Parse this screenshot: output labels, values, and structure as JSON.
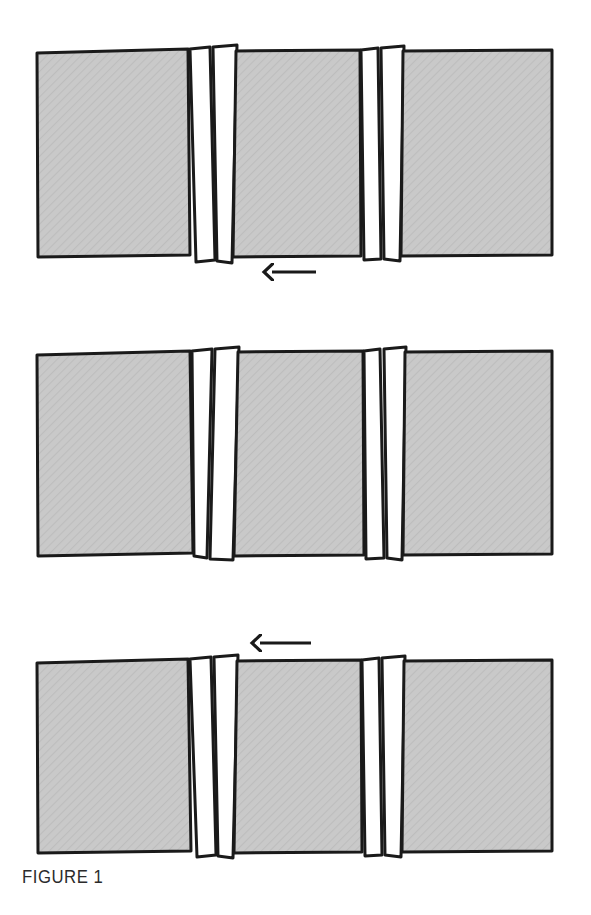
{
  "figure": {
    "caption": "FIGURE 1",
    "title": "FIGURE 1",
    "type": "patent-line-drawing",
    "background_color": "#ffffff",
    "stroke_color": "#1a1a1a",
    "panel_fill_color": "#c9c9c9",
    "strip_fill_color": "#ffffff",
    "hatch_color": "#b3b3b3",
    "canvas": {
      "width": 591,
      "height": 915
    }
  },
  "assemblies": [
    {
      "id": "assembly-top",
      "label": "Top assembly",
      "order": 1,
      "bounds": {
        "x": 36,
        "y": 50,
        "width": 517,
        "height": 208
      },
      "panels": [
        {
          "id": "top-panel-left",
          "label": "Left panel",
          "fill": "#c9c9c9"
        },
        {
          "id": "top-panel-center",
          "label": "Center panel",
          "fill": "#c9c9c9"
        },
        {
          "id": "top-panel-right",
          "label": "Right panel",
          "fill": "#c9c9c9"
        }
      ],
      "joints": [
        {
          "id": "top-joint-left",
          "label": "Left joint",
          "strips": [
            {
              "id": "top-joint-left-strip-1",
              "label": "Strip 1",
              "fill": "#ffffff"
            },
            {
              "id": "top-joint-left-strip-2",
              "label": "Strip 2",
              "fill": "#ffffff"
            }
          ]
        },
        {
          "id": "top-joint-right",
          "label": "Right joint",
          "strips": [
            {
              "id": "top-joint-right-strip-1",
              "label": "Strip 1",
              "fill": "#ffffff"
            },
            {
              "id": "top-joint-right-strip-2",
              "label": "Strip 2",
              "fill": "#ffffff"
            }
          ]
        }
      ]
    },
    {
      "id": "assembly-middle",
      "label": "Middle assembly",
      "order": 2,
      "bounds": {
        "x": 36,
        "y": 350,
        "width": 517,
        "height": 207
      },
      "panels": [
        {
          "id": "middle-panel-left",
          "label": "Left panel",
          "fill": "#c9c9c9"
        },
        {
          "id": "middle-panel-center",
          "label": "Center panel",
          "fill": "#c9c9c9"
        },
        {
          "id": "middle-panel-right",
          "label": "Right panel",
          "fill": "#c9c9c9"
        }
      ],
      "joints": [
        {
          "id": "middle-joint-left",
          "label": "Left joint",
          "strips": [
            {
              "id": "middle-joint-left-strip-1",
              "label": "Strip 1",
              "fill": "#ffffff"
            },
            {
              "id": "middle-joint-left-strip-2",
              "label": "Strip 2",
              "fill": "#ffffff"
            }
          ]
        },
        {
          "id": "middle-joint-right",
          "label": "Right joint",
          "strips": [
            {
              "id": "middle-joint-right-strip-1",
              "label": "Strip 1",
              "fill": "#ffffff"
            },
            {
              "id": "middle-joint-right-strip-2",
              "label": "Strip 2",
              "fill": "#ffffff"
            }
          ]
        }
      ]
    },
    {
      "id": "assembly-bottom",
      "label": "Bottom assembly",
      "order": 3,
      "bounds": {
        "x": 36,
        "y": 658,
        "width": 517,
        "height": 197
      },
      "panels": [
        {
          "id": "bottom-panel-left",
          "label": "Left panel",
          "fill": "#c9c9c9"
        },
        {
          "id": "bottom-panel-center",
          "label": "Center panel",
          "fill": "#c9c9c9"
        },
        {
          "id": "bottom-panel-right",
          "label": "Right panel",
          "fill": "#c9c9c9"
        }
      ],
      "joints": [
        {
          "id": "bottom-joint-left",
          "label": "Left joint",
          "strips": [
            {
              "id": "bottom-joint-left-strip-1",
              "label": "Strip 1",
              "fill": "#ffffff"
            },
            {
              "id": "bottom-joint-left-strip-2",
              "label": "Strip 2",
              "fill": "#ffffff"
            }
          ]
        },
        {
          "id": "bottom-joint-right",
          "label": "Right joint",
          "strips": [
            {
              "id": "bottom-joint-right-strip-1",
              "label": "Strip 1",
              "fill": "#ffffff"
            },
            {
              "id": "bottom-joint-right-strip-2",
              "label": "Strip 2",
              "fill": "#ffffff"
            }
          ]
        }
      ]
    }
  ],
  "arrows": [
    {
      "id": "arrow-down",
      "label": "Downward arrow",
      "direction": "down",
      "from": "assembly-top",
      "to": "assembly-middle",
      "x": 316,
      "y_start": 272,
      "y_end": 334
    },
    {
      "id": "arrow-up",
      "label": "Upward arrow",
      "direction": "up",
      "from": "assembly-bottom",
      "to": "assembly-middle",
      "x": 311,
      "y_start": 643,
      "y_end": 573
    }
  ]
}
